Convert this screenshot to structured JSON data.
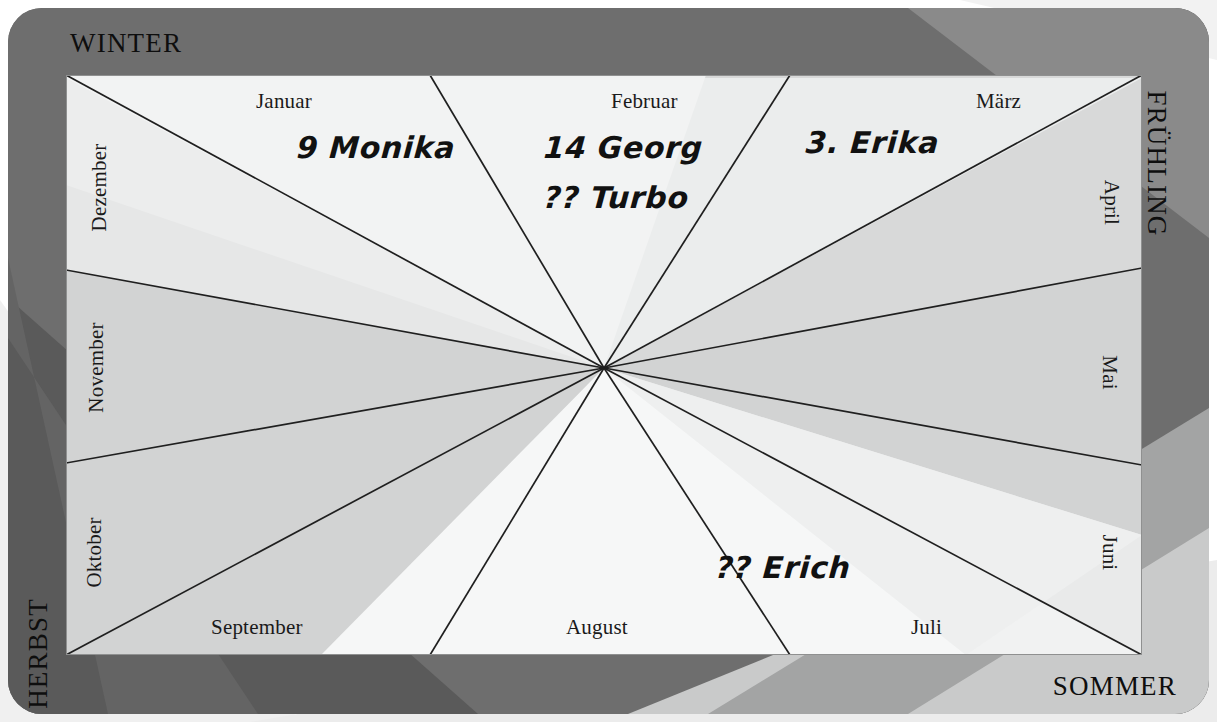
{
  "colors": {
    "frame": "#6e6e6e",
    "frame_dark_band": "#5f5f5f",
    "frame_light_band": "#8d8d8d",
    "panel_light": "#f2f3f3",
    "panel_mid": "#e4e5e5",
    "panel_dark": "#d4d5d5",
    "page_light": "#f4f4f4",
    "page_mid": "#e3e4e4",
    "line": "#1f1f1f",
    "text": "#111111"
  },
  "seasons": [
    {
      "id": "winter",
      "label": "WINTER",
      "position": "top-left"
    },
    {
      "id": "fruehling",
      "label": "FRÜHLING",
      "position": "right-top"
    },
    {
      "id": "sommer",
      "label": "SOMMER",
      "position": "bottom-right"
    },
    {
      "id": "herbst",
      "label": "HERBST",
      "position": "left-bottom"
    }
  ],
  "months": [
    {
      "id": "januar",
      "label": "Januar",
      "edge": "top",
      "orientation": "horizontal"
    },
    {
      "id": "februar",
      "label": "Februar",
      "edge": "top",
      "orientation": "horizontal"
    },
    {
      "id": "maerz",
      "label": "März",
      "edge": "top",
      "orientation": "horizontal"
    },
    {
      "id": "april",
      "label": "April",
      "edge": "right",
      "orientation": "vertical"
    },
    {
      "id": "mai",
      "label": "Mai",
      "edge": "right",
      "orientation": "vertical"
    },
    {
      "id": "juni",
      "label": "Juni",
      "edge": "right",
      "orientation": "vertical"
    },
    {
      "id": "juli",
      "label": "Juli",
      "edge": "bottom",
      "orientation": "horizontal"
    },
    {
      "id": "august",
      "label": "August",
      "edge": "bottom",
      "orientation": "horizontal"
    },
    {
      "id": "september",
      "label": "September",
      "edge": "bottom",
      "orientation": "horizontal"
    },
    {
      "id": "oktober",
      "label": "Oktober",
      "edge": "left",
      "orientation": "vertical"
    },
    {
      "id": "november",
      "label": "November",
      "edge": "left",
      "orientation": "vertical"
    },
    {
      "id": "dezember",
      "label": "Dezember",
      "edge": "left",
      "orientation": "vertical"
    }
  ],
  "entries": [
    {
      "id": "monika",
      "month": "januar",
      "day": "9",
      "name": "Monika",
      "text": "9 Monika"
    },
    {
      "id": "georg",
      "month": "februar",
      "day": "14",
      "name": "Georg",
      "text": "14 Georg"
    },
    {
      "id": "turbo",
      "month": "februar",
      "day": "??",
      "name": "Turbo",
      "text": "?? Turbo"
    },
    {
      "id": "erika",
      "month": "maerz",
      "day": "3.",
      "name": "Erika",
      "text": "3. Erika"
    },
    {
      "id": "erich",
      "month": "juli",
      "day": "??",
      "name": "Erich",
      "text": "?? Erich"
    }
  ],
  "geometry": {
    "center_x": 604,
    "center_y": 368,
    "panel_left": 66,
    "panel_top": 75,
    "panel_width": 1076,
    "panel_height": 580,
    "sector_count": 12
  }
}
